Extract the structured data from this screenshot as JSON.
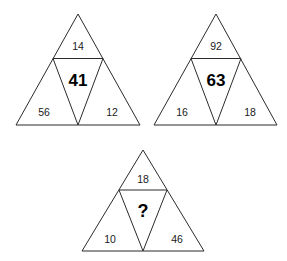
{
  "figure": {
    "kind": "number-puzzle",
    "shape": "triangle",
    "background_color": "#ffffff",
    "stroke_color": "#2b2b2b",
    "text_color": "#1a1a1a",
    "unknown_marker": "?"
  },
  "triangles": [
    {
      "id": "triangle-1",
      "apex": "14",
      "center": "41",
      "bottom_left": "56",
      "bottom_right": "12"
    },
    {
      "id": "triangle-2",
      "apex": "92",
      "center": "63",
      "bottom_left": "16",
      "bottom_right": "18"
    },
    {
      "id": "triangle-3",
      "apex": "18",
      "center": "?",
      "bottom_left": "10",
      "bottom_right": "46"
    }
  ]
}
